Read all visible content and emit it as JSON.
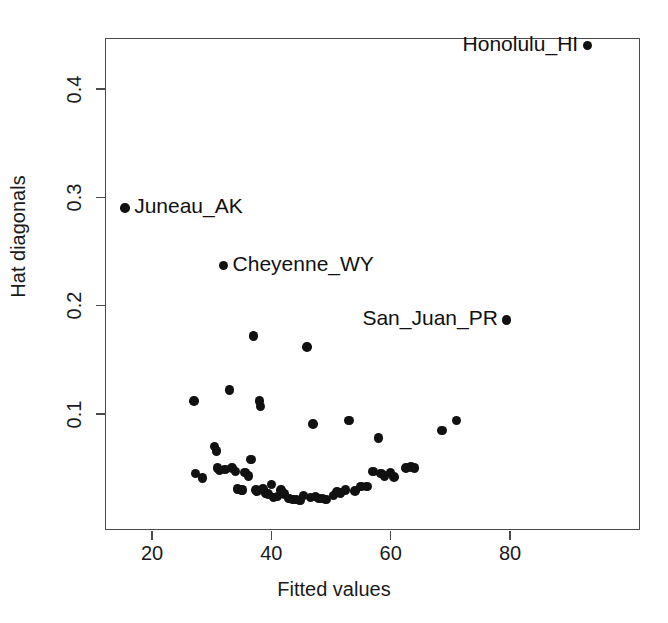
{
  "chart_data": {
    "type": "scatter",
    "title": "",
    "xlabel": "Fitted values",
    "ylabel": "Hat diagonals",
    "xlim": [
      13,
      103
    ],
    "ylim": [
      0.012,
      0.462
    ],
    "xticks": [
      20,
      40,
      60,
      80
    ],
    "xtick_labels": [
      "20",
      "40",
      "60",
      "80"
    ],
    "yticks": [
      0.1,
      0.2,
      0.3,
      0.4
    ],
    "ytick_labels": [
      "0.1",
      "0.2",
      "0.3",
      "0.4"
    ],
    "grid": false,
    "legend": "none",
    "marker": "filled-circle",
    "marker_color": "#111111",
    "frame_color": "#4a4a4a",
    "x": [
      15.5,
      27.0,
      27.3,
      28.5,
      30.5,
      30.8,
      31.0,
      31.3,
      32.0,
      32.2,
      33.0,
      33.4,
      34.0,
      34.3,
      35.0,
      35.2,
      35.6,
      36.2,
      36.6,
      37.0,
      37.4,
      37.6,
      38.0,
      38.2,
      38.6,
      39.0,
      39.4,
      40.0,
      40.4,
      41.0,
      41.6,
      42.2,
      43.0,
      43.6,
      44.2,
      44.8,
      45.4,
      46.0,
      46.6,
      47.0,
      47.4,
      48.0,
      48.6,
      49.2,
      50.4,
      51.0,
      51.6,
      52.4,
      53.0,
      54.0,
      55.0,
      56.0,
      57.0,
      58.0,
      58.4,
      59.0,
      60.0,
      60.6,
      62.6,
      63.4,
      64.0,
      68.6,
      71.0,
      79.4,
      93.0
    ],
    "y": [
      0.29,
      0.112,
      0.045,
      0.041,
      0.07,
      0.066,
      0.05,
      0.048,
      0.237,
      0.049,
      0.122,
      0.05,
      0.047,
      0.031,
      0.03,
      0.03,
      0.046,
      0.043,
      0.058,
      0.172,
      0.03,
      0.029,
      0.112,
      0.107,
      0.031,
      0.027,
      0.026,
      0.035,
      0.023,
      0.024,
      0.03,
      0.026,
      0.022,
      0.021,
      0.021,
      0.02,
      0.025,
      0.162,
      0.023,
      0.091,
      0.024,
      0.022,
      0.022,
      0.021,
      0.025,
      0.028,
      0.027,
      0.03,
      0.094,
      0.029,
      0.033,
      0.033,
      0.047,
      0.078,
      0.045,
      0.043,
      0.046,
      0.042,
      0.05,
      0.051,
      0.05,
      0.085,
      0.094,
      0.187,
      0.44
    ],
    "labeled_points": [
      {
        "name": "Honolulu_HI",
        "x": 93.0,
        "y": 0.44,
        "label_side": "left"
      },
      {
        "name": "Juneau_AK",
        "x": 15.5,
        "y": 0.29,
        "label_side": "right"
      },
      {
        "name": "Cheyenne_WY",
        "x": 32.0,
        "y": 0.237,
        "label_side": "right"
      },
      {
        "name": "San_Juan_PR",
        "x": 79.4,
        "y": 0.187,
        "label_side": "left"
      }
    ]
  }
}
